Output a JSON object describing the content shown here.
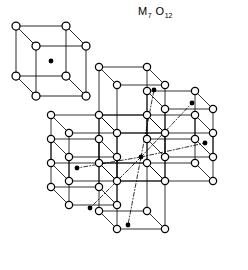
{
  "figure": {
    "title_m": "M",
    "title_m_sub": "7",
    "title_o": "O",
    "title_o_sub": "12",
    "caption_full": "M7 O12",
    "background_color": "#ffffff",
    "line_color": "#000000",
    "open_circle_fill": "#ffffff",
    "filled_dot_color": "#000000",
    "legend_name": "body-centered-cube-unit",
    "cluster_name": "seven-cube-cluster"
  },
  "structure_data": {
    "type": "crystal-structure-diagram",
    "compound": "M7O12",
    "projection": "oblique",
    "cube_edge_px": 48,
    "depth_dx_px": -18,
    "depth_dy_px": -18,
    "anion_symbol": "open-circle",
    "cation_symbol": "filled-dot",
    "anion_radius_px": 3.6,
    "cation_radius_px": 2.4,
    "legend_cube": {
      "origin_x": 36,
      "origin_y": 96,
      "edge": 50,
      "dx": -20,
      "dy": -20,
      "corner_count": 8,
      "center_dot_count": 1
    },
    "cluster_cubes": [
      {
        "id": "center",
        "ox": 117,
        "oy": 181,
        "center_dot": [
          141,
          157
        ]
      },
      {
        "id": "upper-left",
        "ox": 117,
        "oy": 133,
        "center_dot": [
          154,
          90
        ]
      },
      {
        "id": "upper-right",
        "ox": 165,
        "oy": 157,
        "center_dot": [
          192,
          103
        ]
      },
      {
        "id": "right",
        "ox": 165,
        "oy": 181,
        "center_dot": [
          205,
          143
        ]
      },
      {
        "id": "left",
        "ox": 69,
        "oy": 181,
        "center_dot": [
          77,
          168
        ]
      },
      {
        "id": "lower-left",
        "ox": 69,
        "oy": 205,
        "center_dot": [
          90,
          208
        ]
      },
      {
        "id": "lower-right",
        "ox": 117,
        "oy": 229,
        "center_dot": [
          128,
          225
        ]
      }
    ],
    "diagonal_lines": [
      {
        "from": [
          141,
          157
        ],
        "to": [
          154,
          90
        ],
        "style": "dash-dot"
      },
      {
        "from": [
          141,
          157
        ],
        "to": [
          192,
          103
        ],
        "style": "dash-dot"
      },
      {
        "from": [
          141,
          157
        ],
        "to": [
          205,
          143
        ],
        "style": "dash-dot"
      },
      {
        "from": [
          141,
          157
        ],
        "to": [
          77,
          168
        ],
        "style": "dash-dot"
      },
      {
        "from": [
          141,
          157
        ],
        "to": [
          90,
          208
        ],
        "style": "dash-dot"
      },
      {
        "from": [
          141,
          157
        ],
        "to": [
          128,
          225
        ],
        "style": "dash-dot"
      }
    ],
    "counts": {
      "cubes_in_cluster": 7,
      "center_dots_in_cluster": 7,
      "legend_cubes": 1
    }
  }
}
